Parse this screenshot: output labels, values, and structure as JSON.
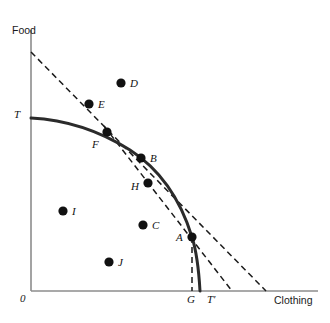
{
  "figure": {
    "type": "economics-ppf-diagram",
    "background": "#ffffff"
  },
  "axes": {
    "y_label": "Food",
    "x_label": "Clothing",
    "origin_label": "0",
    "color": "#8c8c8c",
    "y_axis": {
      "x": 31,
      "y_top": 30,
      "y_bottom": 291
    },
    "x_axis": {
      "y": 291,
      "x_left": 31,
      "x_right": 318
    }
  },
  "ticks": [
    {
      "name": "y-intercept-T",
      "label": "T",
      "x": 14,
      "y": 109
    },
    {
      "name": "x-tick-G",
      "label": "G",
      "x": 187,
      "y": 294
    },
    {
      "name": "x-tick-Tprime",
      "label": "T′",
      "x": 207,
      "y": 294
    }
  ],
  "curve": {
    "name": "production-possibility-frontier",
    "color": "#2b2b2b",
    "width": 3,
    "path": "M 31 118 C 70 120 103 133 130 150 C 158 168 180 198 192 237 C 197 253 199 273 200 291"
  },
  "lines": [
    {
      "name": "budget-line-T",
      "style": "dashed",
      "color": "#1a1a1a",
      "x1": 31,
      "y1": 52,
      "x2": 266,
      "y2": 291
    },
    {
      "name": "price-line-tangent-A",
      "style": "dashed",
      "color": "#1a1a1a",
      "x1": 104,
      "y1": 126,
      "x2": 232,
      "y2": 291
    },
    {
      "name": "quantity-G-dropline",
      "style": "dashed",
      "color": "#1a1a1a",
      "x1": 192,
      "y1": 237,
      "x2": 192,
      "y2": 291
    }
  ],
  "points": [
    {
      "id": "D",
      "label": "D",
      "x": 121,
      "y": 83,
      "lx": 130,
      "ly": 78,
      "r": 4.6
    },
    {
      "id": "E",
      "label": "E",
      "x": 89,
      "y": 104,
      "lx": 98,
      "ly": 99,
      "r": 4.6
    },
    {
      "id": "F",
      "label": "F",
      "x": 107,
      "y": 132,
      "lx": 92,
      "ly": 139,
      "r": 4.6
    },
    {
      "id": "B",
      "label": "B",
      "x": 141,
      "y": 158,
      "lx": 150,
      "ly": 153,
      "r": 4.6
    },
    {
      "id": "H",
      "label": "H",
      "x": 148,
      "y": 183,
      "lx": 131,
      "ly": 181,
      "r": 4.6
    },
    {
      "id": "I",
      "label": "I",
      "x": 63,
      "y": 211,
      "lx": 72,
      "ly": 206,
      "r": 4.6
    },
    {
      "id": "C",
      "label": "C",
      "x": 143,
      "y": 225,
      "lx": 152,
      "ly": 220,
      "r": 4.6
    },
    {
      "id": "A",
      "label": "A",
      "x": 192,
      "y": 237,
      "lx": 176,
      "ly": 232,
      "r": 4.6
    },
    {
      "id": "J",
      "label": "J",
      "x": 109,
      "y": 262,
      "lx": 118,
      "ly": 257,
      "r": 4.6
    }
  ]
}
